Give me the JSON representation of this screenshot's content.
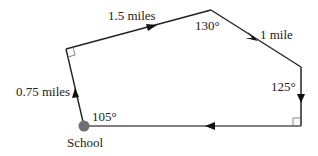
{
  "diagram": {
    "type": "route-polygon",
    "start_label": "School",
    "legs": [
      {
        "from": "School",
        "to": "V1",
        "label": "0.75 miles",
        "direction": "up"
      },
      {
        "from": "V1",
        "to": "V2",
        "label": "1.5 miles",
        "direction": "up-right"
      },
      {
        "from": "V2",
        "to": "V3",
        "label": "1 mile",
        "direction": "down-right"
      },
      {
        "from": "V3",
        "to": "V4",
        "label": "",
        "direction": "down"
      },
      {
        "from": "V4",
        "to": "School",
        "label": "",
        "direction": "left"
      }
    ],
    "angles": {
      "school": "105°",
      "v1": "right-angle",
      "v2": "130°",
      "v3": "125°",
      "v4": "right-angle"
    },
    "labels": {
      "school": "School",
      "leg1": "0.75 miles",
      "leg2": "1.5 miles",
      "leg3": "1 mile",
      "angle_school": "105°",
      "angle_top": "130°",
      "angle_right": "125°"
    },
    "colors": {
      "line": "#222222",
      "school_dot": "#707070",
      "bottom_line": "#555555"
    }
  }
}
